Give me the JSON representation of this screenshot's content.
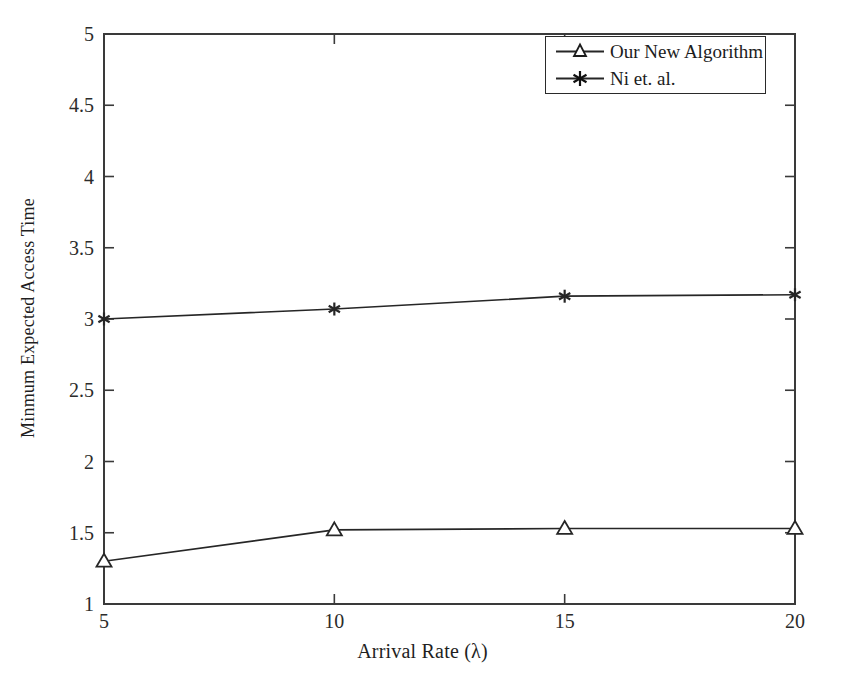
{
  "chart_data": {
    "type": "line",
    "title": "",
    "xlabel": "Arrival Rate (λ)",
    "ylabel": "Minmum Expected Access Time",
    "x": [
      5,
      10,
      15,
      20
    ],
    "xlim": [
      5,
      20
    ],
    "ylim": [
      1,
      5
    ],
    "xticks": [
      "5",
      "10",
      "15",
      "20"
    ],
    "yticks": [
      "1",
      "1.5",
      "2",
      "2.5",
      "3",
      "3.5",
      "4",
      "4.5",
      "5"
    ],
    "grid": false,
    "legend_position": "top-right",
    "series": [
      {
        "name": "Our New Algorithm",
        "marker": "triangle-open",
        "color": "#262626",
        "values": [
          1.3,
          1.52,
          1.53,
          1.53
        ]
      },
      {
        "name": "Ni et. al.",
        "marker": "asterisk",
        "color": "#262626",
        "values": [
          3.0,
          3.07,
          3.16,
          3.17
        ]
      }
    ]
  },
  "axes": {
    "y_tick_labels": [
      "5",
      "4.5",
      "4",
      "3.5",
      "3",
      "2.5",
      "2",
      "1.5",
      "1"
    ],
    "x_tick_labels": [
      "5",
      "10",
      "15",
      "20"
    ],
    "x_axis_title": "Arrival Rate (λ)",
    "y_axis_title": "Minmum Expected Access Time"
  },
  "legend": {
    "entries": [
      {
        "label": "Our New Algorithm",
        "marker": "triangle-open"
      },
      {
        "label": "Ni et. al.",
        "marker": "asterisk"
      }
    ]
  },
  "style": {
    "background": "#ffffff",
    "line_color": "#262626",
    "axis_color": "#333333",
    "text_color": "#1f1f1f"
  }
}
